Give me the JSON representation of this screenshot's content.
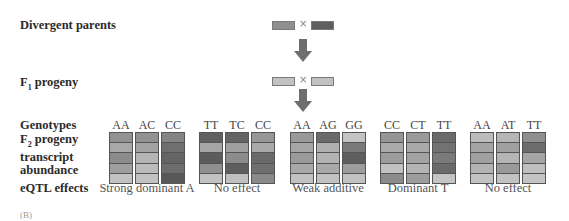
{
  "labels": {
    "parents": "Divergent parents",
    "f1": "F",
    "f1_sub": "1",
    "f1_rest": " progeny",
    "genotypes": "Genotypes",
    "f2_line1_pre": "F",
    "f2_sub": "2",
    "f2_line1_rest": " progeny",
    "f2_line2": "transcript",
    "f2_line3": "abundance",
    "eqtl": "eQTL effects",
    "cross_symbol": "×",
    "footer": "(B)"
  },
  "colors": {
    "L": "#c6c6c6",
    "ML": "#a9a9a9",
    "M": "#919191",
    "MD": "#7a7a7a",
    "D": "#5f5f5f"
  },
  "parents": {
    "left": "#8f8f8f",
    "right": "#5e5e5e"
  },
  "f1": {
    "left": "#c2c2c2",
    "right": "#c2c2c2"
  },
  "blocks": [
    {
      "effect": "Strong dominant A",
      "genotypes": [
        "AA",
        "AC",
        "CC"
      ],
      "columns": [
        [
          "#929292",
          "#a8a8a8",
          "#8c8c8c",
          "#9f9f9f",
          "#c2c2c2"
        ],
        [
          "#929292",
          "#a3a3a3",
          "#b5b5b5",
          "#bcbcbc",
          "#c2c2c2"
        ],
        [
          "#848484",
          "#6f6f6f",
          "#656565",
          "#6d6d6d",
          "#585858"
        ]
      ]
    },
    {
      "effect": "No effect",
      "genotypes": [
        "TT",
        "TC",
        "CC"
      ],
      "columns": [
        [
          "#606060",
          "#a5a5a5",
          "#5c5c5c",
          "#8f8f8f",
          "#c2c2c2"
        ],
        [
          "#646464",
          "#a0a0a0",
          "#8c8c8c",
          "#5e5e5e",
          "#c0c0c0"
        ],
        [
          "#979797",
          "#a9a9a9",
          "#6a6a6a",
          "#6f6f6f",
          "#8a8a8a"
        ]
      ]
    },
    {
      "effect": "Weak additive",
      "genotypes": [
        "AA",
        "AG",
        "GG"
      ],
      "columns": [
        [
          "#9a9a9a",
          "#a5a5a5",
          "#9a9a9a",
          "#a8a8a8",
          "#c2c2c2"
        ],
        [
          "#6a6a6a",
          "#b0b0b0",
          "#b3b3b3",
          "#a9a9a9",
          "#c2c2c2"
        ],
        [
          "#c4c4c4",
          "#7a7a7a",
          "#5e5e5e",
          "#9d9d9d",
          "#c2c2c2"
        ]
      ]
    },
    {
      "effect": "Dominant T",
      "genotypes": [
        "CC",
        "CT",
        "TT"
      ],
      "columns": [
        [
          "#959595",
          "#aaaaaa",
          "#9c9c9c",
          "#c2c2c2",
          "#8b8b8b"
        ],
        [
          "#9a9a9a",
          "#a9a9a9",
          "#a3a3a3",
          "#b4b4b4",
          "#9c9c9c"
        ],
        [
          "#6b6b6b",
          "#727272",
          "#7a7a7a",
          "#6a6a6a",
          "#c5c5c5"
        ]
      ]
    },
    {
      "effect": "No effect",
      "genotypes": [
        "AA",
        "AT",
        "TT"
      ],
      "columns": [
        [
          "#bcbcbc",
          "#a4a4a4",
          "#a0a0a0",
          "#b3b3b3",
          "#c2c2c2"
        ],
        [
          "#b5b5b5",
          "#a0a0a0",
          "#b4b4b4",
          "#9a9a9a",
          "#c2c2c2"
        ],
        [
          "#8f8f8f",
          "#6c6c6c",
          "#a5a5a5",
          "#c0c0c0",
          "#c4c4c4"
        ]
      ]
    }
  ]
}
